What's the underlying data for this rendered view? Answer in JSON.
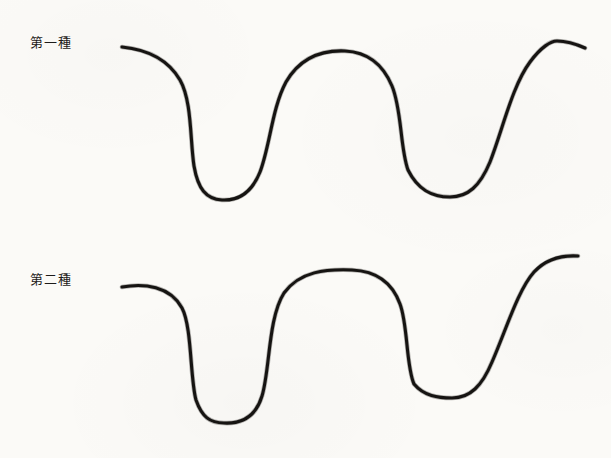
{
  "page": {
    "width": 611,
    "height": 458,
    "background_color": "#fbfaf7",
    "ink_color": "#161412",
    "kind": "scanned-figure"
  },
  "labels": {
    "first": "第一種",
    "second": "第二種"
  },
  "chart_data": {
    "type": "line",
    "title": "",
    "subtitle": "",
    "xlabel": "",
    "ylabel": "",
    "grid": false,
    "legend_position": "left",
    "axis_visible": false,
    "xlim": [
      0,
      611
    ],
    "ylim": [
      0,
      458
    ],
    "note": "Two hand-drawn waveform curves on scanned paper; y values are pixel coordinates measured downward from the top of the image.",
    "series": [
      {
        "name": "第一種",
        "label_position": {
          "x": 30,
          "y": 36
        },
        "stroke": "#161412",
        "stroke_width": 3.1,
        "start_point": {
          "x": 122,
          "y": 47
        },
        "end_point": {
          "x": 585,
          "y": 48
        },
        "extrema": [
          {
            "kind": "start",
            "x": 122,
            "y": 47
          },
          {
            "kind": "trough",
            "x": 222,
            "y": 200
          },
          {
            "kind": "peak",
            "x": 345,
            "y": 51
          },
          {
            "kind": "trough",
            "x": 450,
            "y": 197
          },
          {
            "kind": "peak",
            "x": 557,
            "y": 41
          },
          {
            "kind": "end",
            "x": 585,
            "y": 48
          }
        ],
        "path": "M 122 47 C 142 49 166 56 180 80 C 192 101 190 140 194 166 C 198 189 206 199 222 200 C 240 201 252 192 260 172 C 270 146 272 108 286 82 C 300 58 322 50 345 51 C 366 52 382 62 392 86 C 402 110 400 148 408 170 C 418 190 432 197 450 197 C 468 197 480 186 490 162 C 502 132 512 86 530 62 C 541 47 551 41 557 41 C 566 41 576 44 585 48"
      },
      {
        "name": "第二種",
        "label_position": {
          "x": 30,
          "y": 273
        },
        "stroke": "#161412",
        "stroke_width": 3.1,
        "start_point": {
          "x": 122,
          "y": 287
        },
        "end_point": {
          "x": 578,
          "y": 256
        },
        "extrema": [
          {
            "kind": "start",
            "x": 122,
            "y": 287
          },
          {
            "kind": "trough",
            "x": 224,
            "y": 423
          },
          {
            "kind": "peak",
            "x": 352,
            "y": 270
          },
          {
            "kind": "trough",
            "x": 452,
            "y": 398
          },
          {
            "kind": "end",
            "x": 578,
            "y": 256
          }
        ],
        "path": "M 122 287 C 144 283 170 286 182 308 C 192 327 190 378 196 400 C 202 417 210 423 224 423 C 243 424 256 416 262 396 C 270 370 268 318 284 293 C 300 271 326 269 352 270 C 376 271 392 282 400 304 C 408 325 406 366 414 384 C 424 396 438 398 452 398 C 470 398 482 386 492 362 C 506 330 518 290 534 272 C 546 259 562 255 578 256"
      }
    ]
  }
}
